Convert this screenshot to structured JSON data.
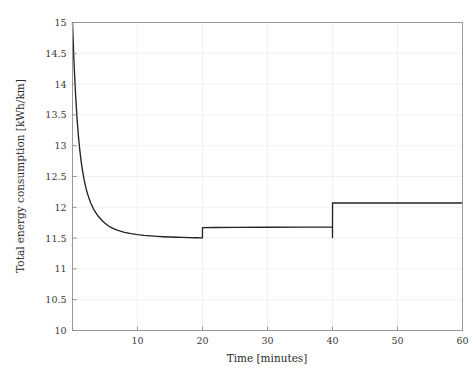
{
  "figure": {
    "background_color": "#ffffff",
    "frame_color": "#9a9a9a",
    "grid_color": "#ededed",
    "curve_color": "#232323"
  },
  "chart_data": {
    "type": "line",
    "title": "",
    "subtitle": "",
    "xlabel": "Time [minutes]",
    "ylabel": "Total energy consumption [kWh/km]",
    "xlim": [
      0,
      60
    ],
    "ylim": [
      10,
      15
    ],
    "grid": true,
    "legend": null,
    "legend_position": "none",
    "xticks": [
      0,
      10,
      20,
      30,
      40,
      50,
      60
    ],
    "xticklabels": [
      "0",
      "10",
      "20",
      "30",
      "40",
      "50",
      "60"
    ],
    "yticks": [
      10,
      10.5,
      11,
      11.5,
      12,
      12.5,
      13,
      13.5,
      14,
      14.5,
      15
    ],
    "yticklabels": [
      "10",
      "10.5",
      "11",
      "11.5",
      "12",
      "12.5",
      "13",
      "13.5",
      "14",
      "14.5",
      "15"
    ],
    "series": [
      {
        "name": "Total energy consumption",
        "color": "#232323",
        "x": [
          0.0,
          0.15,
          0.3,
          0.5,
          0.7,
          0.9,
          1.1,
          1.3,
          1.5,
          1.8,
          2.1,
          2.4,
          2.8,
          3.2,
          3.6,
          4.0,
          4.5,
          5.0,
          5.5,
          6.0,
          6.5,
          7.0,
          7.5,
          8.0,
          9.0,
          10.0,
          11.0,
          12.0,
          13.0,
          14.0,
          15.0,
          16.0,
          17.0,
          18.0,
          19.0,
          19.99,
          20.0,
          22.0,
          25.0,
          30.0,
          35.0,
          39.0,
          39.99,
          40.0,
          40.01,
          41.0,
          42.0,
          45.0,
          50.0,
          55.0,
          60.0
        ],
        "y": [
          15.0,
          14.58,
          14.2,
          13.78,
          13.44,
          13.17,
          12.95,
          12.77,
          12.62,
          12.44,
          12.3,
          12.19,
          12.07,
          11.98,
          11.91,
          11.85,
          11.79,
          11.74,
          11.7,
          11.67,
          11.645,
          11.625,
          11.608,
          11.594,
          11.572,
          11.556,
          11.544,
          11.535,
          11.528,
          11.522,
          11.518,
          11.514,
          11.511,
          11.508,
          11.506,
          11.504,
          11.67,
          11.672,
          11.674,
          11.676,
          11.678,
          11.679,
          11.68,
          11.51,
          12.07,
          12.07,
          12.07,
          12.07,
          12.07,
          12.07,
          12.07
        ]
      }
    ],
    "annotations": [
      {
        "label": "initial value",
        "x": 0,
        "y": 15.0
      },
      {
        "label": "asymptote before first step",
        "x": 20,
        "y": 11.5
      },
      {
        "label": "first step up",
        "x": 20,
        "y": 11.67
      },
      {
        "label": "drop at second step",
        "x": 40,
        "y": 11.51
      },
      {
        "label": "second step up",
        "x": 40,
        "y": 12.07
      },
      {
        "label": "final value",
        "x": 60,
        "y": 12.07
      }
    ]
  }
}
